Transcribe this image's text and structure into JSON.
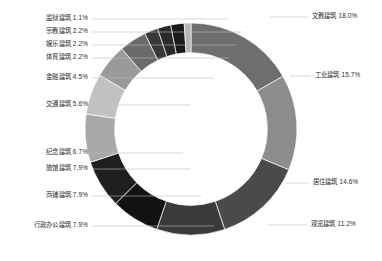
{
  "chart_data": {
    "type": "pie",
    "variant": "donut",
    "title": "",
    "subtitle": "",
    "xlabel": "",
    "ylabel": "",
    "legend_position": "callout-labels",
    "grid": false,
    "units": "percent",
    "total": 100.0,
    "inner_radius_ratio": 0.72,
    "start_angle_deg": -90,
    "direction": "clockwise",
    "categories": [
      "文教建筑",
      "工业建筑",
      "居住建筑",
      "观览建筑",
      "行政办公建筑",
      "商铺建筑",
      "旅馆建筑",
      "纪念建筑",
      "交通建筑",
      "金融建筑",
      "体育建筑",
      "娱乐建筑",
      "宗教建筑",
      "监狱建筑"
    ],
    "values": [
      18.0,
      15.7,
      14.6,
      11.2,
      7.9,
      7.9,
      7.9,
      6.7,
      5.6,
      4.5,
      2.2,
      2.2,
      2.2,
      1.1
    ],
    "colors": [
      "#6e6e6e",
      "#8c8c8c",
      "#4a4a4a",
      "#3a3a3a",
      "#121212",
      "#1f1f1f",
      "#a8a8a8",
      "#c2c2c2",
      "#9a9a9a",
      "#6a6a6a",
      "#383838",
      "#2a2a2a",
      "#1a1a1a",
      "#b5b5b5"
    ]
  },
  "labels": [
    {
      "text": "监狱建筑 1.1%",
      "category": "监狱建筑",
      "value": 1.1,
      "side": "left",
      "x": 88,
      "y": 22
    },
    {
      "text": "宗教建筑 2.2%",
      "category": "宗教建筑",
      "value": 2.2,
      "side": "left",
      "x": 88,
      "y": 35
    },
    {
      "text": "娱乐建筑 2.2%",
      "category": "娱乐建筑",
      "value": 2.2,
      "side": "left",
      "x": 88,
      "y": 48
    },
    {
      "text": "体育建筑 2.2%",
      "category": "体育建筑",
      "value": 2.2,
      "side": "left",
      "x": 88,
      "y": 61
    },
    {
      "text": "金融建筑 4.5%",
      "category": "金融建筑",
      "value": 4.5,
      "side": "left",
      "x": 88,
      "y": 81
    },
    {
      "text": "交通建筑 5.6%",
      "category": "交通建筑",
      "value": 5.6,
      "side": "left",
      "x": 88,
      "y": 108
    },
    {
      "text": "纪念建筑 6.7%",
      "category": "纪念建筑",
      "value": 6.7,
      "side": "left",
      "x": 88,
      "y": 156
    },
    {
      "text": "旅馆建筑 7.9%",
      "category": "旅馆建筑",
      "value": 7.9,
      "side": "left",
      "x": 88,
      "y": 172
    },
    {
      "text": "商铺建筑 7.9%",
      "category": "商铺建筑",
      "value": 7.9,
      "side": "left",
      "x": 88,
      "y": 199
    },
    {
      "text": "行政办公建筑 7.9%",
      "category": "行政办公建筑",
      "value": 7.9,
      "side": "left",
      "x": 88,
      "y": 229
    },
    {
      "text": "文教建筑 18.0%",
      "category": "文教建筑",
      "value": 18.0,
      "side": "right",
      "x": 312,
      "y": 20
    },
    {
      "text": "工业建筑 15.7%",
      "category": "工业建筑",
      "value": 15.7,
      "side": "right",
      "x": 315,
      "y": 79
    },
    {
      "text": "居住建筑 14.6%",
      "category": "居住建筑",
      "value": 14.6,
      "side": "right",
      "x": 313,
      "y": 186
    },
    {
      "text": "观览建筑 11.2%",
      "category": "观览建筑",
      "value": 11.2,
      "side": "right",
      "x": 311,
      "y": 228
    }
  ],
  "leaders": [
    {
      "name": "leader-prison",
      "x1": 92,
      "y1": 19,
      "x2": 228,
      "y2": 19
    },
    {
      "name": "leader-religion",
      "x1": 92,
      "y1": 32,
      "x2": 242,
      "y2": 32
    },
    {
      "name": "leader-entertain",
      "x1": 92,
      "y1": 45,
      "x2": 236,
      "y2": 45
    },
    {
      "name": "leader-sports",
      "x1": 92,
      "y1": 58,
      "x2": 229,
      "y2": 58
    },
    {
      "name": "leader-finance",
      "x1": 92,
      "y1": 78,
      "x2": 214,
      "y2": 78
    },
    {
      "name": "leader-transport",
      "x1": 92,
      "y1": 105,
      "x2": 190,
      "y2": 105
    },
    {
      "name": "leader-memorial",
      "x1": 92,
      "y1": 153,
      "x2": 183,
      "y2": 153
    },
    {
      "name": "leader-hotel",
      "x1": 92,
      "y1": 169,
      "x2": 190,
      "y2": 169
    },
    {
      "name": "leader-shop",
      "x1": 92,
      "y1": 196,
      "x2": 201,
      "y2": 196
    },
    {
      "name": "leader-admin",
      "x1": 92,
      "y1": 226,
      "x2": 214,
      "y2": 226
    },
    {
      "name": "leader-education",
      "x1": 270,
      "y1": 17,
      "x2": 308,
      "y2": 17
    },
    {
      "name": "leader-industry",
      "x1": 290,
      "y1": 76,
      "x2": 311,
      "y2": 76
    },
    {
      "name": "leader-residential",
      "x1": 286,
      "y1": 183,
      "x2": 309,
      "y2": 183
    },
    {
      "name": "leader-sightseeing",
      "x1": 268,
      "y1": 225,
      "x2": 307,
      "y2": 225
    }
  ]
}
